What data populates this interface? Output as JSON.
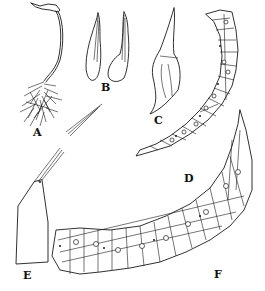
{
  "figure": {
    "type": "botanical-plate",
    "background": "#ffffff",
    "ink": "#1a1a1a",
    "panels": [
      {
        "id": "A",
        "label": "A",
        "description": "whole plant with sporophyte"
      },
      {
        "id": "B",
        "label": "B",
        "description": "two leaves"
      },
      {
        "id": "C",
        "label": "C",
        "description": "calyptra / capsule"
      },
      {
        "id": "D",
        "label": "D",
        "description": "leaf cross-section (narrow)"
      },
      {
        "id": "E",
        "label": "E",
        "description": "leaf base with awn"
      },
      {
        "id": "F",
        "label": "F",
        "description": "leaf cross-section (broad)"
      }
    ]
  }
}
